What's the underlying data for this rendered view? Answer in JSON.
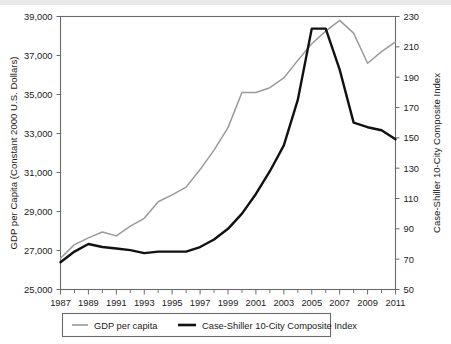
{
  "chart_data": {
    "type": "line",
    "title": "",
    "xlabel": "",
    "ylabel": "GDP per Capita (Constant 2000 U.S. Dollars)",
    "y2label": "Case-Shiller 10-City Composite Index",
    "grid": false,
    "legend_position": "bottom",
    "x": [
      1987,
      1988,
      1989,
      1990,
      1991,
      1992,
      1993,
      1994,
      1995,
      1996,
      1997,
      1998,
      1999,
      2000,
      2001,
      2002,
      2003,
      2004,
      2005,
      2006,
      2007,
      2008,
      2009,
      2010,
      2011
    ],
    "xlim": [
      1987,
      2011
    ],
    "ylim": [
      25000,
      39000
    ],
    "y2lim": [
      50,
      230
    ],
    "ytick_labels": [
      "25,000",
      "27,000",
      "29,000",
      "31,000",
      "33,000",
      "35,000",
      "37,000",
      "39,000"
    ],
    "ytick_values": [
      25000,
      27000,
      29000,
      31000,
      33000,
      35000,
      37000,
      39000
    ],
    "y2tick_labels": [
      "50",
      "70",
      "90",
      "110",
      "130",
      "150",
      "170",
      "190",
      "210",
      "230"
    ],
    "y2tick_values": [
      50,
      70,
      90,
      110,
      130,
      150,
      170,
      190,
      210,
      230
    ],
    "xtick_labels": [
      "1987",
      "1989",
      "1991",
      "1993",
      "1995",
      "1997",
      "1999",
      "2001",
      "2003",
      "2005",
      "2007",
      "2009",
      "2011"
    ],
    "xtick_values": [
      1987,
      1989,
      1991,
      1993,
      1995,
      1997,
      1999,
      2001,
      2003,
      2005,
      2007,
      2009,
      2011
    ],
    "series": [
      {
        "name": "GDP per capita",
        "axis": "left",
        "color": "#9a9a9a",
        "values": [
          26600,
          27300,
          27650,
          27950,
          27750,
          28250,
          28650,
          29500,
          29850,
          30250,
          31150,
          32150,
          33300,
          35100,
          35100,
          35350,
          35850,
          36750,
          37600,
          38250,
          38800,
          38150,
          36600,
          37200,
          37700
        ]
      },
      {
        "name": "Case-Shiller 10-City Composite Index",
        "axis": "right",
        "color": "#111111",
        "values": [
          68,
          75,
          80,
          78,
          77,
          76,
          74,
          75,
          75,
          75,
          78,
          83,
          90,
          100,
          113,
          128,
          145,
          175,
          222,
          222,
          195,
          160,
          157,
          155,
          149
        ]
      }
    ]
  },
  "legend": {
    "entries": [
      {
        "label": "GDP per capita",
        "style": "thin-gray"
      },
      {
        "label": "Case-Shiller 10-City Composite Index",
        "style": "thick-black"
      }
    ]
  }
}
